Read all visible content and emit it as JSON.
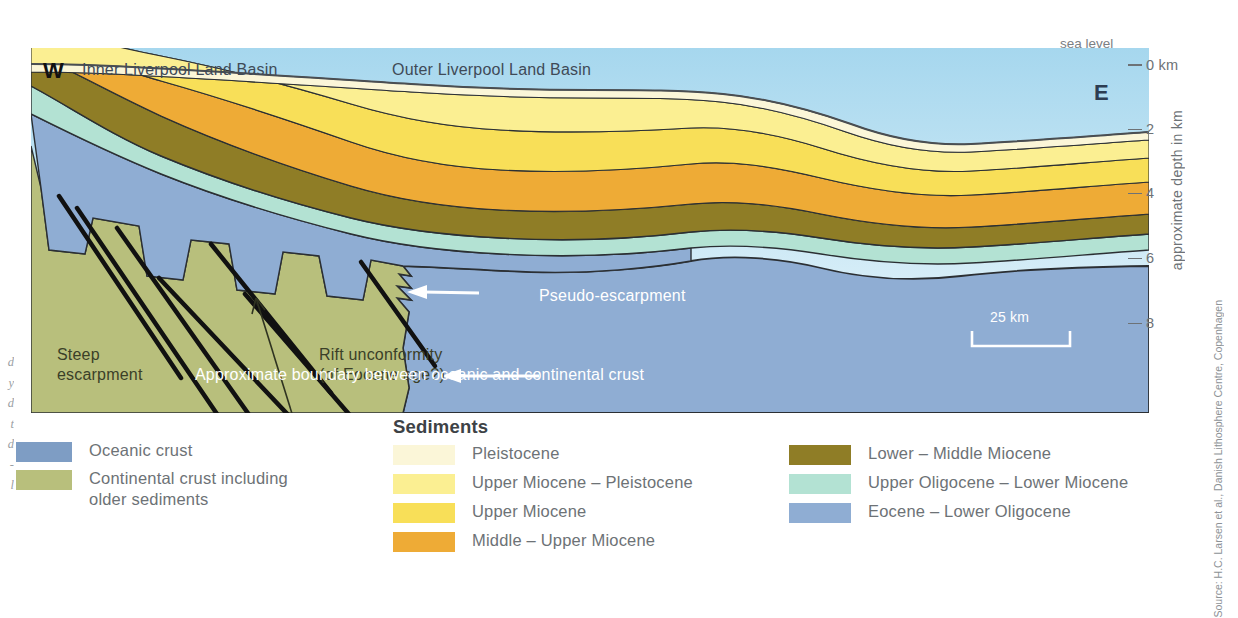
{
  "figure": {
    "sea_level_label": "sea level",
    "axis_title": "approximate depth in km",
    "ticks": [
      {
        "label": "0 km",
        "depth_km": 0
      },
      {
        "label": "2",
        "depth_km": 2
      },
      {
        "label": "4",
        "depth_km": 4
      },
      {
        "label": "6",
        "depth_km": 6
      },
      {
        "label": "8",
        "depth_km": 8
      }
    ],
    "compass_west": "W",
    "compass_east": "E",
    "basin_labels": [
      "Inner Liverpool Land Basin",
      "Outer Liverpool Land Basin"
    ],
    "annotations": {
      "steep_escarpment_line1": "Steep",
      "steep_escarpment_line2": "escarpment",
      "rift_unconformity_line1": "Rift unconformity",
      "rift_unconformity_line2": "(of Eocene age?)",
      "pseudo_escarpment": "Pseudo-escarpment",
      "crust_boundary": "Approximate boundary between oceanic and continental crust"
    },
    "scale_bar_label": "25 km"
  },
  "legend": {
    "sediments_heading": "Sediments",
    "crust": [
      {
        "label": "Oceanic crust",
        "color": "#7e9dc4"
      },
      {
        "label": "Continental crust including\nolder sediments",
        "color": "#b8bf7c"
      }
    ],
    "sediments_left": [
      {
        "label": "Pleistocene",
        "color": "#fbf6d8"
      },
      {
        "label": "Upper Miocene – Pleistocene",
        "color": "#fbef92"
      },
      {
        "label": "Upper Miocene",
        "color": "#f8df58"
      },
      {
        "label": "Middle – Upper Miocene",
        "color": "#eeab36"
      }
    ],
    "sediments_right": [
      {
        "label": "Lower – Middle Miocene",
        "color": "#8f7d26"
      },
      {
        "label": "Upper Oligocene – Lower Miocene",
        "color": "#b3e2d3"
      },
      {
        "label": "Eocene – Lower Oligocene",
        "color": "#8fadd3"
      }
    ]
  },
  "source_credit": "Source: H.C. Larsen et al., Danish Lithosphere Centre, Copenhagen",
  "bleed_text_lines": [
    "d",
    "y",
    "d",
    "t",
    "d",
    "-",
    "l"
  ],
  "colors": {
    "sky_top": "#a8d8ef",
    "sky_bottom": "#eaf6fb",
    "oceanic_crust": "#7e9dc4",
    "continental_crust": "#b8bf7c",
    "pleistocene": "#fbf6d8",
    "upper_miocene_pleistocene": "#fbef92",
    "upper_miocene": "#f8df58",
    "middle_upper_miocene": "#eeab36",
    "lower_middle_miocene": "#8f7d26",
    "upper_oligocene_lower_miocene": "#b3e2d3",
    "eocene_lower_oligocene": "#8fadd3",
    "outline": "#55595c",
    "text_grey": "#6d7276"
  }
}
